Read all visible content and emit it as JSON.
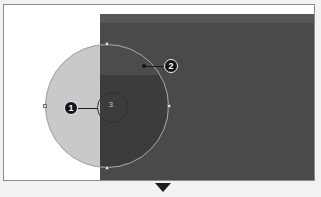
{
  "canvas": {
    "name": "image-canvas",
    "background_color": "#ffffff",
    "border_color": "#8d8d8d"
  },
  "overlay": {
    "name": "dark-overlay-rectangle",
    "fill_color": "#4a4a4a",
    "top_band_color": "#585858"
  },
  "shapes": {
    "ellipse": {
      "name": "ellipse-selection",
      "fill_color": "#c9c9c9",
      "stroke_color": "#a9a9a9"
    },
    "inner_circle": {
      "name": "inner-circle-handle",
      "label": "3",
      "stroke_color": "#2f2f2f"
    }
  },
  "handles": [
    {
      "position": "left"
    },
    {
      "position": "right"
    },
    {
      "position": "top"
    },
    {
      "position": "bottom"
    }
  ],
  "callouts": [
    {
      "id": "1",
      "label": "1"
    },
    {
      "id": "2",
      "label": "2"
    }
  ],
  "markers": {
    "bottom_triangle": {
      "name": "bottom-pointer-triangle",
      "color": "#1d1d1d"
    }
  }
}
